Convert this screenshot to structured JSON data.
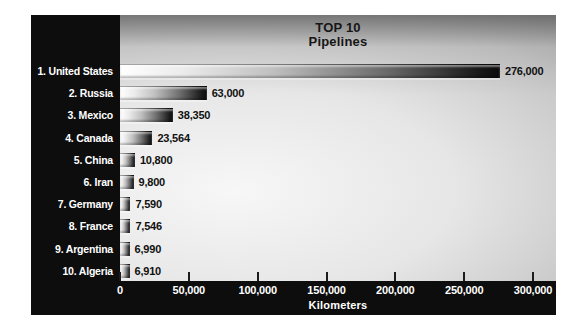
{
  "colors": {
    "frame": "#0d0d0d",
    "bar_start": "#ffffff",
    "bar_end": "#0a0a0a",
    "row_label_text": "#ffffff",
    "value_text": "#111111",
    "axis_text": "#ffffff",
    "title_text": "#161616"
  },
  "chart_data": {
    "type": "bar",
    "orientation": "horizontal",
    "title": "TOP 10",
    "subtitle": "Pipelines",
    "xlabel": "Kilometers",
    "xlim": [
      0,
      300000
    ],
    "grid": false,
    "legend": "none",
    "x_ticks": [
      {
        "value": 0,
        "label": "0"
      },
      {
        "value": 50000,
        "label": "50,000"
      },
      {
        "value": 100000,
        "label": "100,000"
      },
      {
        "value": 150000,
        "label": "150,000"
      },
      {
        "value": 200000,
        "label": "200,000"
      },
      {
        "value": 250000,
        "label": "250,000"
      },
      {
        "value": 300000,
        "label": "300,000"
      }
    ],
    "bars": [
      {
        "rank": 1,
        "label": "1. United States",
        "value": 276000,
        "value_label": "276,000"
      },
      {
        "rank": 2,
        "label": "2. Russia",
        "value": 63000,
        "value_label": "63,000"
      },
      {
        "rank": 3,
        "label": "3. Mexico",
        "value": 38350,
        "value_label": "38,350"
      },
      {
        "rank": 4,
        "label": "4. Canada",
        "value": 23564,
        "value_label": "23,564"
      },
      {
        "rank": 5,
        "label": "5. China",
        "value": 10800,
        "value_label": "10,800"
      },
      {
        "rank": 6,
        "label": "6. Iran",
        "value": 9800,
        "value_label": "9,800"
      },
      {
        "rank": 7,
        "label": "7. Germany",
        "value": 7590,
        "value_label": "7,590"
      },
      {
        "rank": 8,
        "label": "8. France",
        "value": 7546,
        "value_label": "7,546"
      },
      {
        "rank": 9,
        "label": "9. Argentina",
        "value": 6990,
        "value_label": "6,990"
      },
      {
        "rank": 10,
        "label": "10. Algeria",
        "value": 6910,
        "value_label": "6,910"
      }
    ]
  }
}
